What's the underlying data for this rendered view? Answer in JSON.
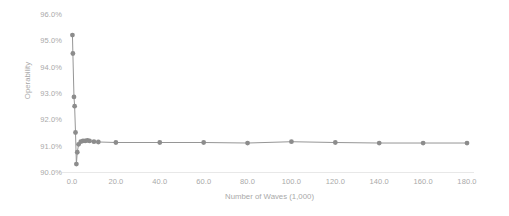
{
  "chart_data": {
    "type": "line",
    "title": "",
    "xlabel": "Number of Waves (1,000)",
    "ylabel": "Operability",
    "xlim": [
      0,
      180
    ],
    "ylim": [
      0.9,
      0.96
    ],
    "grid": false,
    "legend": null,
    "y_tick_format": "percent_1dp",
    "x_ticks": [
      0.0,
      20.0,
      40.0,
      60.0,
      80.0,
      100.0,
      120.0,
      140.0,
      160.0,
      180.0
    ],
    "x_tick_labels": [
      "0.0",
      "20.0",
      "40.0",
      "60.0",
      "80.0",
      "100.0",
      "120.0",
      "140.0",
      "160.0",
      "180.0"
    ],
    "y_ticks": [
      0.9,
      0.91,
      0.92,
      0.93,
      0.94,
      0.95,
      0.96
    ],
    "y_tick_labels": [
      "90.0%",
      "91.0%",
      "92.0%",
      "93.0%",
      "94.0%",
      "95.0%",
      "96.0%"
    ],
    "series": [
      {
        "name": "Operability",
        "color": "#969696",
        "marker": "circle",
        "x": [
          0.2,
          0.4,
          0.9,
          1.2,
          1.6,
          2.0,
          2.4,
          3.0,
          4.0,
          5.0,
          6.0,
          7.0,
          8.0,
          10.0,
          12.0,
          20.0,
          40.0,
          60.0,
          80.0,
          100.0,
          120.0,
          140.0,
          160.0,
          180.0
        ],
        "y": [
          0.952,
          0.945,
          0.9285,
          0.925,
          0.915,
          0.903,
          0.9075,
          0.9105,
          0.9115,
          0.9118,
          0.9118,
          0.912,
          0.9118,
          0.9115,
          0.9114,
          0.9112,
          0.9112,
          0.9112,
          0.911,
          0.9115,
          0.9112,
          0.911,
          0.911,
          0.911
        ]
      }
    ]
  },
  "axis": {
    "y_title": "Operability",
    "x_title": "Number of Waves (1,000)"
  },
  "style": {
    "line_color": "#969696",
    "marker_color": "#8c8c8c",
    "text_color": "#a9a9a9",
    "axis_color": "#e8e8e8",
    "background": "#ffffff"
  }
}
